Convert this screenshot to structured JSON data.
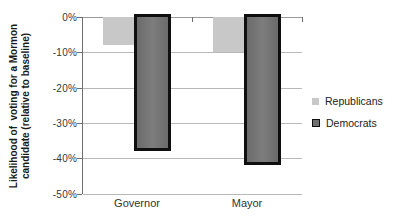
{
  "chart_data": {
    "type": "bar",
    "categories": [
      "Governor",
      "Mayor"
    ],
    "series": [
      {
        "name": "Republicans",
        "values": [
          -8,
          -10
        ],
        "color": "#c8c8c8"
      },
      {
        "name": "Democrats",
        "values": [
          -38,
          -42
        ],
        "color": "#6f6f6f",
        "border_color": "#0f0f0f"
      }
    ],
    "ylabel_lines": [
      "Likelihood of  voting for a Mormon",
      "candidate (relative to baseline)"
    ],
    "ylabel": "Likelihood of voting for a Mormon candidate (relative to baseline)",
    "yticks": [
      "0%",
      "-10%",
      "-20%",
      "-30%",
      "-40%",
      "-50%"
    ],
    "ytick_values": [
      0,
      -10,
      -20,
      -30,
      -40,
      -50
    ],
    "ylim": [
      -50,
      0
    ],
    "xlabel": "",
    "title": "",
    "grid": true,
    "legend_position": "right",
    "colors": {
      "background": "#ffffff",
      "gridline": "#b8b8b8",
      "axis": "#6e6e6e",
      "text": "#333333"
    }
  }
}
